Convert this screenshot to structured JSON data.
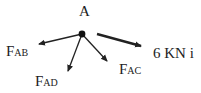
{
  "diagram": {
    "point_label": "A",
    "forces": [
      {
        "id": "FAB",
        "main": "F",
        "sub": "AB"
      },
      {
        "id": "FAD",
        "main": "F",
        "sub": "AD"
      },
      {
        "id": "FAC",
        "main": "F",
        "sub": "AC"
      },
      {
        "id": "applied",
        "text": "6 KN i"
      }
    ],
    "colors": {
      "ink": "#222222",
      "background": "#ffffff"
    }
  }
}
